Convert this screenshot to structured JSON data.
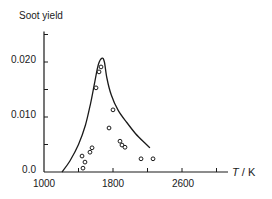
{
  "chart_data": {
    "type": "scatter",
    "title": "",
    "xlabel": "T / K",
    "ylabel": "Soot yield",
    "xlim": [
      1000,
      3100
    ],
    "ylim": [
      0.0,
      0.025
    ],
    "grid": false,
    "legend": null,
    "x_ticks": [
      1000,
      1400,
      1800,
      2200,
      2600,
      3000
    ],
    "x_tick_labels": [
      "1000",
      "1800",
      "2600"
    ],
    "y_ticks": [
      0.0,
      0.005,
      0.01,
      0.015,
      0.02,
      0.025
    ],
    "y_tick_labels": [
      "0.0",
      "0.010",
      "0.020"
    ],
    "series": [
      {
        "name": "measured",
        "kind": "scatter",
        "marker": "open-circle",
        "points": [
          {
            "x": 1441,
            "y": 0.0029
          },
          {
            "x": 1452,
            "y": 0.0007
          },
          {
            "x": 1475,
            "y": 0.0018
          },
          {
            "x": 1533,
            "y": 0.0036
          },
          {
            "x": 1557,
            "y": 0.0044
          },
          {
            "x": 1603,
            "y": 0.0153
          },
          {
            "x": 1638,
            "y": 0.0182
          },
          {
            "x": 1661,
            "y": 0.0191
          },
          {
            "x": 1754,
            "y": 0.008
          },
          {
            "x": 1800,
            "y": 0.0113
          },
          {
            "x": 1881,
            "y": 0.0056
          },
          {
            "x": 1904,
            "y": 0.0049
          },
          {
            "x": 1939,
            "y": 0.0045
          },
          {
            "x": 2125,
            "y": 0.0024
          },
          {
            "x": 2264,
            "y": 0.0024
          }
        ]
      },
      {
        "name": "model",
        "kind": "line",
        "points": [
          {
            "x": 1209,
            "y": 0.0
          },
          {
            "x": 1300,
            "y": 0.002
          },
          {
            "x": 1400,
            "y": 0.005
          },
          {
            "x": 1480,
            "y": 0.0085
          },
          {
            "x": 1540,
            "y": 0.0125
          },
          {
            "x": 1590,
            "y": 0.0165
          },
          {
            "x": 1630,
            "y": 0.0195
          },
          {
            "x": 1672,
            "y": 0.0207
          },
          {
            "x": 1700,
            "y": 0.02
          },
          {
            "x": 1730,
            "y": 0.017
          },
          {
            "x": 1780,
            "y": 0.014
          },
          {
            "x": 1860,
            "y": 0.0112
          },
          {
            "x": 1960,
            "y": 0.009
          },
          {
            "x": 2060,
            "y": 0.007
          },
          {
            "x": 2160,
            "y": 0.0054
          },
          {
            "x": 2229,
            "y": 0.0044
          }
        ]
      }
    ]
  },
  "labels": {
    "y_title": "Soot yield",
    "x_title_var": "T",
    "x_title_unit": " / K",
    "y_0": "0.0",
    "y_010": "0.010",
    "y_020": "0.020",
    "x_1000": "1000",
    "x_1800": "1800",
    "x_2600": "2600"
  }
}
